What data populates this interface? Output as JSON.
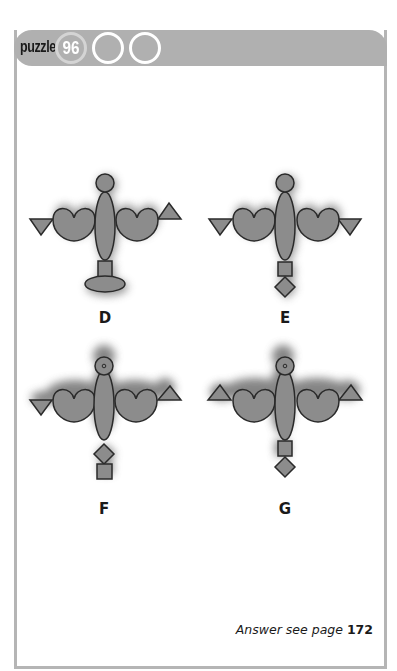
{
  "header": {
    "label": "puzzle",
    "number": "96",
    "empty_circles": 2
  },
  "figures": [
    {
      "label": "D",
      "left_triangle": "down",
      "right_triangle": "up",
      "bottom": [
        "square",
        "ellipse"
      ],
      "head_dot": false
    },
    {
      "label": "E",
      "left_triangle": "down",
      "right_triangle": "down",
      "bottom": [
        "square",
        "diamond"
      ],
      "head_dot": false
    },
    {
      "label": "F",
      "left_triangle": "down",
      "right_triangle": "up",
      "bottom": [
        "diamond",
        "square"
      ],
      "head_dot": true
    },
    {
      "label": "G",
      "left_triangle": "up",
      "right_triangle": "up",
      "bottom": [
        "square",
        "diamond"
      ],
      "head_dot": true
    }
  ],
  "footer": {
    "answer_text": "Answer see page",
    "answer_page": "172"
  },
  "colors": {
    "header_band": "#b0b0b0",
    "shape_fill": "#8c8c8c",
    "shape_stroke": "#2a2a2a",
    "frame": "#b5b5b5"
  }
}
